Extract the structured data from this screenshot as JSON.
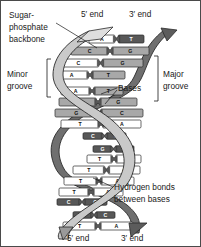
{
  "figure": {
    "background": "#ffffff",
    "border_color": "#4a4a4a",
    "width": 201,
    "height": 247
  },
  "labels": {
    "sugar_phosphate_backbone": [
      "Sugar-",
      "phosphate",
      "backbone"
    ],
    "minor_groove": [
      "Minor",
      "groove"
    ],
    "major_groove": [
      "Major",
      "groove"
    ],
    "bases": "Bases",
    "hydrogen_bonds": [
      "Hydrogen bonds",
      "between bases"
    ],
    "top_five_prime": "5′ end",
    "top_three_prime": "3′ end",
    "bottom_five_prime": "5′ end",
    "bottom_three_prime": "3′ end"
  },
  "colors": {
    "backbone_front": "#c9c9c9",
    "backbone_back": "#6f6f6f",
    "base_light": "#ffffff",
    "base_mid": "#a8a8a8",
    "base_dark": "#585858",
    "outline": "#2a2a2a",
    "text": "#1a1a1a"
  },
  "chart_data": {
    "type": "diagram",
    "base_pairs": [
      {
        "index": 1,
        "left": "A",
        "right": "T",
        "left_shade": "light",
        "right_shade": "dark",
        "y": 38,
        "x1": 88,
        "x2": 143,
        "depth": "front"
      },
      {
        "index": 2,
        "left": "C",
        "right": "G",
        "left_shade": "mid",
        "right_shade": "mid",
        "y": 50,
        "x1": 70,
        "x2": 148,
        "depth": "front"
      },
      {
        "index": 3,
        "left": "C",
        "right": "G",
        "left_shade": "light",
        "right_shade": "mid",
        "y": 62,
        "x1": 57,
        "x2": 142,
        "depth": "front"
      },
      {
        "index": 4,
        "left": "A",
        "right": "T",
        "left_shade": "light",
        "right_shade": "mid",
        "y": 74,
        "x1": 54,
        "x2": 124,
        "depth": "front"
      },
      {
        "index": 5,
        "left": "A",
        "right": "T",
        "left_shade": "light",
        "right_shade": "mid",
        "y": 90,
        "x1": 60,
        "x2": 122,
        "depth": "front"
      },
      {
        "index": 6,
        "left": "C",
        "right": "G",
        "left_shade": "mid",
        "right_shade": "mid",
        "y": 101,
        "x1": 58,
        "x2": 136,
        "depth": "front"
      },
      {
        "index": 7,
        "left": "G",
        "right": "C",
        "left_shade": "mid",
        "right_shade": "mid",
        "y": 112,
        "x1": 54,
        "x2": 142,
        "depth": "front"
      },
      {
        "index": 8,
        "left": "T",
        "right": "A",
        "left_shade": "light",
        "right_shade": "light",
        "y": 123,
        "x1": 60,
        "x2": 140,
        "depth": "front"
      },
      {
        "index": 9,
        "left": "C",
        "right": "G",
        "left_shade": "dark",
        "right_shade": "dark",
        "y": 135,
        "x1": 82,
        "x2": 125,
        "depth": "back"
      },
      {
        "index": 10,
        "left": "G",
        "right": "C",
        "left_shade": "dark",
        "right_shade": "dark",
        "y": 148,
        "x1": 92,
        "x2": 133,
        "depth": "back"
      },
      {
        "index": 11,
        "left": "T",
        "right": "A",
        "left_shade": "light",
        "right_shade": "light",
        "y": 158,
        "x1": 86,
        "x2": 140,
        "depth": "front"
      },
      {
        "index": 12,
        "left": "T",
        "right": "A",
        "left_shade": "light",
        "right_shade": "light",
        "y": 169,
        "x1": 72,
        "x2": 139,
        "depth": "front"
      },
      {
        "index": 13,
        "left": "T",
        "right": "A",
        "left_shade": "light",
        "right_shade": "light",
        "y": 180,
        "x1": 63,
        "x2": 133,
        "depth": "front"
      },
      {
        "index": 14,
        "left": "T",
        "right": "A",
        "left_shade": "light",
        "right_shade": "light",
        "y": 191,
        "x1": 58,
        "x2": 122,
        "depth": "front"
      },
      {
        "index": 15,
        "left": "C",
        "right": "G",
        "left_shade": "dark",
        "right_shade": "dark",
        "y": 201,
        "x1": 56,
        "x2": 106,
        "depth": "back"
      },
      {
        "index": 16,
        "left": "G",
        "right": "C",
        "left_shade": "dark",
        "right_shade": "dark",
        "y": 214,
        "x1": 72,
        "x2": 114,
        "depth": "back"
      },
      {
        "index": 17,
        "left": "T",
        "right": "A",
        "left_shade": "light",
        "right_shade": "light",
        "y": 225,
        "x1": 62,
        "x2": 132,
        "depth": "front"
      }
    ],
    "strand_count": 2
  }
}
